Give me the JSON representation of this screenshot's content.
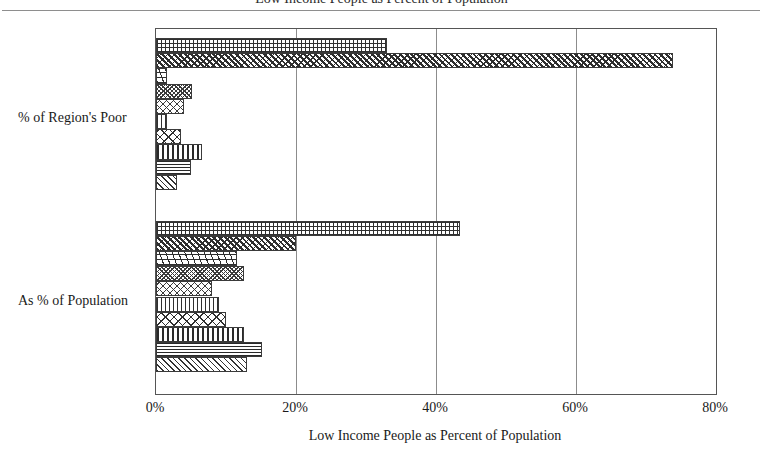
{
  "figure": {
    "title": "Low Income People as Percent of Population",
    "title_clipped": true
  },
  "axes": {
    "x_title": "Low Income People as Percent of Population",
    "x_ticks": [
      "0%",
      "20%",
      "40%",
      "60%",
      "80%"
    ],
    "y_categories": [
      "% of Region's Poor",
      "As % of Population"
    ]
  },
  "chart_data": {
    "type": "bar",
    "orientation": "horizontal",
    "title": "Low Income People as Percent of Population",
    "xlabel": "Low Income People as Percent of Population",
    "ylabel": "",
    "xlim": [
      0,
      80
    ],
    "xtick_values": [
      0,
      20,
      40,
      60,
      80
    ],
    "xtick_labels": [
      "0%",
      "20%",
      "40%",
      "60%",
      "80%"
    ],
    "grid": true,
    "legend": "none",
    "categories": [
      "% of Region's Poor",
      "As % of Population"
    ],
    "groups": [
      {
        "category": "% of Region's Poor",
        "bars": [
          {
            "pattern": "grid",
            "value": 33.0
          },
          {
            "pattern": "diagdots",
            "value": 73.9
          },
          {
            "pattern": "wavy",
            "value": 1.6
          },
          {
            "pattern": "densediag",
            "value": 5.1
          },
          {
            "pattern": "dots",
            "value": 4.0
          },
          {
            "pattern": "vlines",
            "value": 1.6
          },
          {
            "pattern": "crossdiag",
            "value": 3.6
          },
          {
            "pattern": "vthick",
            "value": 6.6
          },
          {
            "pattern": "hlines",
            "value": 5.0
          },
          {
            "pattern": "diaghatch",
            "value": 3.0
          }
        ]
      },
      {
        "category": "As % of Population",
        "bars": [
          {
            "pattern": "grid",
            "value": 43.4
          },
          {
            "pattern": "diagdots",
            "value": 20.0
          },
          {
            "pattern": "wavy",
            "value": 11.6
          },
          {
            "pattern": "densediag",
            "value": 12.6
          },
          {
            "pattern": "dots",
            "value": 8.0
          },
          {
            "pattern": "vlines",
            "value": 9.0
          },
          {
            "pattern": "crossdiag",
            "value": 10.0
          },
          {
            "pattern": "vthick",
            "value": 12.6
          },
          {
            "pattern": "hlines",
            "value": 15.1
          },
          {
            "pattern": "diaghatch",
            "value": 13.0
          }
        ]
      }
    ]
  }
}
